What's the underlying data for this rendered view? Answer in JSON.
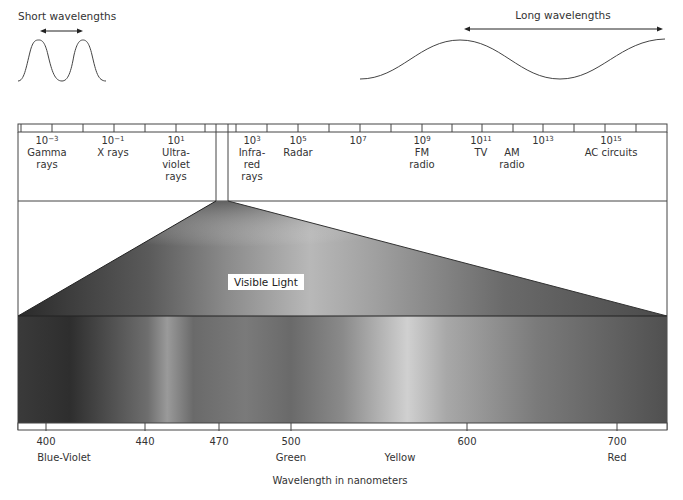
{
  "title_short": "Short wavelengths",
  "title_long": "Long wavelengths",
  "spectrum_scale": [
    {
      "base": "10",
      "exp": "−3",
      "name": [
        "Gamma",
        "rays"
      ],
      "x": 47
    },
    {
      "base": "10",
      "exp": "−1",
      "name": [
        "X rays"
      ],
      "x": 113
    },
    {
      "base": "10",
      "exp": "1",
      "name": [
        "Ultra-",
        "violet",
        "rays"
      ],
      "x": 176
    },
    {
      "base": "10",
      "exp": "3",
      "name": [
        "Infra-",
        "red",
        "rays"
      ],
      "x": 252
    },
    {
      "base": "10",
      "exp": "5",
      "name": [
        "Radar"
      ],
      "x": 298
    },
    {
      "base": "10",
      "exp": "7",
      "name": [],
      "x": 358
    },
    {
      "base": "10",
      "exp": "9",
      "name": [
        "FM",
        "radio"
      ],
      "x": 422
    },
    {
      "base": "10",
      "exp": "11",
      "name": [
        "TV"
      ],
      "x": 481
    },
    {
      "base": "10",
      "exp": "13",
      "name": [],
      "x": 543
    },
    {
      "base": "10",
      "exp": "15",
      "name": [
        "AC circuits"
      ],
      "x": 611
    }
  ],
  "extra_labels": [
    {
      "name": [
        "AM",
        "radio"
      ],
      "x": 512
    }
  ],
  "visible_light_label": "Visible Light",
  "wavelength_axis": {
    "ticks": [
      {
        "value": "400",
        "x": 46
      },
      {
        "value": "440",
        "x": 145
      },
      {
        "value": "470",
        "x": 219
      },
      {
        "value": "500",
        "x": 291
      },
      {
        "value": "600",
        "x": 467
      },
      {
        "value": "700",
        "x": 617
      }
    ],
    "color_names": [
      {
        "name": "Blue-Violet",
        "x": 64
      },
      {
        "name": "Green",
        "x": 291
      },
      {
        "name": "Yellow",
        "x": 400
      },
      {
        "name": "Red",
        "x": 617
      }
    ],
    "axis_label": "Wavelength  in nanometers"
  }
}
